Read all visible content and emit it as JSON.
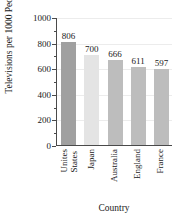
{
  "chart_data": {
    "type": "bar",
    "title": "",
    "xlabel": "Country",
    "ylabel": "Televisions per 1000 People",
    "categories": [
      "Unites States",
      "Japan",
      "Australia",
      "England",
      "France"
    ],
    "category_lines": [
      [
        "Unites",
        "States"
      ],
      [
        "Japan"
      ],
      [
        "Australia"
      ],
      [
        "England"
      ],
      [
        "France"
      ]
    ],
    "values": [
      806,
      700,
      666,
      611,
      597
    ],
    "value_labels": [
      "806",
      "700",
      "666",
      "611",
      "597"
    ],
    "bar_colors": [
      "#a0a0a0",
      "#e4e4e4",
      "#bdbdbd",
      "#bdbdbd",
      "#bdbdbd"
    ],
    "ylim": [
      0,
      1000
    ],
    "ytick_labels": [
      "0",
      "200",
      "400",
      "600",
      "800",
      "1000"
    ],
    "ytick_values": [
      0,
      200,
      400,
      600,
      800,
      1000
    ],
    "yminor_values": [
      100,
      300,
      500,
      700,
      900
    ],
    "grid": true,
    "grid_color": "#ececec",
    "legend": "none",
    "axis_color": "#4a4a4a"
  }
}
